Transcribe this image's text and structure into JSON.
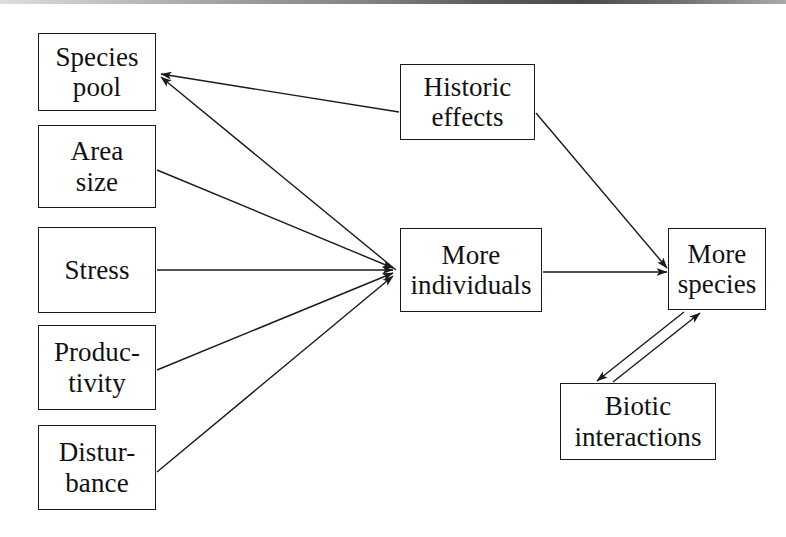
{
  "diagram": {
    "background_color": "#ffffff",
    "line_color": "#1a1a1a",
    "text_color": "#111111",
    "nodes": [
      {
        "id": "species_pool",
        "label": "Species\npool",
        "x": 38,
        "y": 33,
        "w": 118,
        "h": 78,
        "font_size": 27
      },
      {
        "id": "area_size",
        "label": "Area\nsize",
        "x": 38,
        "y": 125,
        "w": 118,
        "h": 83,
        "font_size": 27
      },
      {
        "id": "stress",
        "label": "Stress",
        "x": 38,
        "y": 227,
        "w": 118,
        "h": 86,
        "font_size": 27
      },
      {
        "id": "productivity",
        "label": "Produc-\ntivity",
        "x": 38,
        "y": 325,
        "w": 118,
        "h": 85,
        "font_size": 27
      },
      {
        "id": "disturbance",
        "label": "Distur-\nbance",
        "x": 38,
        "y": 425,
        "w": 118,
        "h": 85,
        "font_size": 27
      },
      {
        "id": "historic_effects",
        "label": "Historic\neffects",
        "x": 400,
        "y": 64,
        "w": 135,
        "h": 76,
        "font_size": 27
      },
      {
        "id": "more_individuals",
        "label": "More\nindividuals",
        "x": 400,
        "y": 228,
        "w": 142,
        "h": 84,
        "font_size": 27
      },
      {
        "id": "more_species",
        "label": "More\nspecies",
        "x": 668,
        "y": 228,
        "w": 98,
        "h": 82,
        "font_size": 27
      },
      {
        "id": "biotic_interactions",
        "label": "Biotic\ninteractions",
        "x": 560,
        "y": 383,
        "w": 156,
        "h": 77,
        "font_size": 27
      }
    ],
    "edges": [
      {
        "id": "historic-to-species-pool",
        "from": "historic_effects",
        "to": "species_pool",
        "arrowhead": "end"
      },
      {
        "id": "more-individuals-to-species-pool",
        "from": "more_individuals",
        "to": "species_pool",
        "arrowhead": "end"
      },
      {
        "id": "area-size-to-more-individuals",
        "from": "area_size",
        "to": "more_individuals",
        "arrowhead": "end"
      },
      {
        "id": "stress-to-more-individuals",
        "from": "stress",
        "to": "more_individuals",
        "arrowhead": "end"
      },
      {
        "id": "productivity-to-more-individuals",
        "from": "productivity",
        "to": "more_individuals",
        "arrowhead": "end"
      },
      {
        "id": "disturbance-to-more-individuals",
        "from": "disturbance",
        "to": "more_individuals",
        "arrowhead": "end"
      },
      {
        "id": "more-individuals-to-more-species",
        "from": "more_individuals",
        "to": "more_species",
        "arrowhead": "end"
      },
      {
        "id": "historic-to-more-species",
        "from": "historic_effects",
        "to": "more_species",
        "arrowhead": "end"
      },
      {
        "id": "biotic-to-more-species",
        "from": "biotic_interactions",
        "to": "more_species",
        "arrowhead": "end"
      },
      {
        "id": "more-species-to-biotic",
        "from": "more_species",
        "to": "biotic_interactions",
        "arrowhead": "end"
      }
    ]
  }
}
